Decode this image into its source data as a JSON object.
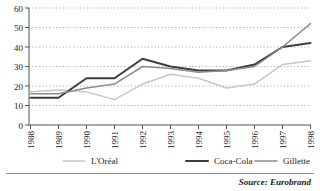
{
  "chart_data": {
    "type": "line",
    "title": "",
    "subtitle": "",
    "xlabel": "",
    "ylabel": "",
    "grid": true,
    "legend_position": "bottom",
    "ylim": [
      0,
      60
    ],
    "yticks": [
      0,
      10,
      20,
      30,
      40,
      50,
      60
    ],
    "categories": [
      "1988",
      "1989",
      "1990",
      "1991",
      "1992",
      "1993",
      "1994",
      "1995",
      "1996",
      "1997",
      "1998"
    ],
    "series": [
      {
        "name": "L'Oréal",
        "color": "#c7c7c7",
        "values": [
          17,
          18,
          17,
          13,
          21,
          26,
          24,
          19,
          21,
          31,
          33
        ]
      },
      {
        "name": "Coca-Cola",
        "color": "#3d3d3d",
        "values": [
          14,
          14,
          24,
          24,
          34,
          30,
          28,
          28,
          31,
          40,
          42
        ]
      },
      {
        "name": "Gillette",
        "color": "#8c8c8c",
        "values": [
          16,
          16,
          19,
          21,
          30,
          29,
          27,
          28,
          30,
          40,
          52
        ]
      }
    ],
    "annotations": {
      "source": "Source: Eurobrand"
    }
  },
  "legend": {
    "items": [
      {
        "label": "L'Oréal",
        "color": "#c7c7c7"
      },
      {
        "label": "Coca-Cola",
        "color": "#3d3d3d"
      },
      {
        "label": "Gillette",
        "color": "#8c8c8c"
      }
    ]
  },
  "yticks": {
    "t0": "0",
    "t1": "10",
    "t2": "20",
    "t3": "30",
    "t4": "40",
    "t5": "50",
    "t6": "60"
  },
  "xticks": {
    "t0": "1988",
    "t1": "1989",
    "t2": "1990",
    "t3": "1991",
    "t4": "1992",
    "t5": "1993",
    "t6": "1994",
    "t7": "1995",
    "t8": "1996",
    "t9": "1997",
    "t10": "1998"
  },
  "source": {
    "text": "Source: Eurobrand"
  }
}
